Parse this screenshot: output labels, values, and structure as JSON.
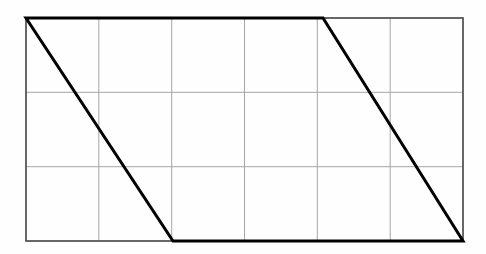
{
  "figure": {
    "canvas": {
      "width": 486,
      "height": 254,
      "background": "#fefefe"
    }
  },
  "chart_data": {
    "type": "diagram",
    "title": "",
    "xlabel": "",
    "ylabel": "",
    "grid": {
      "visible": true,
      "columns": 6,
      "rows": 3,
      "cell_width_px": 72.8,
      "cell_height_px": 74.3,
      "color": "#a6a6a6",
      "stroke_width": 1,
      "x_lines": [
        26,
        98.8,
        171.7,
        244.5,
        317.3,
        390.2,
        463
      ],
      "y_lines": [
        18,
        92.3,
        166.7,
        241
      ]
    },
    "frame": {
      "x0": 26,
      "y0": 18,
      "x1": 463,
      "y1": 241,
      "color": "#4d4d4d",
      "stroke_width": 1.6
    },
    "shapes": [
      {
        "name": "parallelogram",
        "kind": "polygon",
        "closed": true,
        "color": "#000000",
        "stroke_width": 3,
        "fill": "none",
        "vertices": [
          {
            "label": "A",
            "x": 26,
            "y": 18
          },
          {
            "label": "B",
            "x": 323,
            "y": 18
          },
          {
            "label": "C",
            "x": 463,
            "y": 241
          },
          {
            "label": "D",
            "x": 173,
            "y": 241
          }
        ],
        "vertices_grid_units": [
          {
            "label": "A",
            "col": 0,
            "row": 0
          },
          {
            "label": "B",
            "col": 4.08,
            "row": 0
          },
          {
            "label": "C",
            "col": 6,
            "row": 3
          },
          {
            "label": "D",
            "col": 2.02,
            "row": 3
          }
        ],
        "base_grid_units": 4,
        "height_grid_units": 3,
        "slant_grid_units": 2
      }
    ],
    "legend": {
      "visible": false
    },
    "annotations": []
  }
}
